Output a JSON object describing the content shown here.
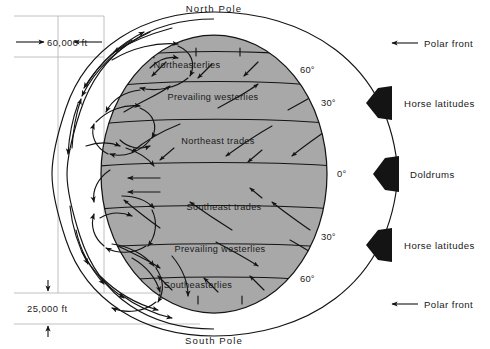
{
  "diagram": {
    "poles": {
      "north": "North Pole",
      "south": "South Pole"
    },
    "altitude_markers": [
      {
        "name": "tropopause-high",
        "label": "60,000 ft"
      },
      {
        "name": "tropopause-low",
        "label": "25,000 ft"
      }
    ],
    "latitude_labels": [
      {
        "name": "lat-60-north",
        "label": "60°"
      },
      {
        "name": "lat-30-north",
        "label": "30°"
      },
      {
        "name": "lat-0-equator",
        "label": "0°"
      },
      {
        "name": "lat-30-south",
        "label": "30°"
      },
      {
        "name": "lat-60-south",
        "label": "60°"
      }
    ],
    "wind_bands": [
      {
        "name": "band-northeasterlies",
        "label": "Northeasterlies",
        "hemisphere": "north"
      },
      {
        "name": "band-prevailing-westerlies-north",
        "label": "Prevailing westerlies",
        "hemisphere": "north"
      },
      {
        "name": "band-northeast-trades",
        "label": "Northeast trades",
        "hemisphere": "north"
      },
      {
        "name": "band-southeast-trades",
        "label": "Southeast trades",
        "hemisphere": "south"
      },
      {
        "name": "band-prevailing-westerlies-south",
        "label": "Prevailing westerlies",
        "hemisphere": "south"
      },
      {
        "name": "band-southeasterlies",
        "label": "Southeasterlies",
        "hemisphere": "south"
      }
    ],
    "side_annotations": [
      {
        "name": "annotation-polar-front-north",
        "label": "Polar front",
        "marker": "plain-arrow"
      },
      {
        "name": "annotation-horse-latitudes-north",
        "label": "Horse latitudes",
        "marker": "block-arrow"
      },
      {
        "name": "annotation-doldrums",
        "label": "Doldrums",
        "marker": "block-arrow"
      },
      {
        "name": "annotation-horse-latitudes-south",
        "label": "Horse latitudes",
        "marker": "block-arrow"
      },
      {
        "name": "annotation-polar-front-south",
        "label": "Polar front",
        "marker": "plain-arrow"
      }
    ],
    "colors": {
      "globe_shading": "#a8a8a8",
      "line": "#141414",
      "background": "#ffffff",
      "rule": "#b9b9b9"
    }
  }
}
